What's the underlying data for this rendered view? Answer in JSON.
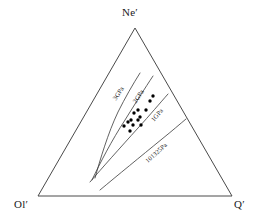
{
  "figure": {
    "type": "ternary-phase-diagram",
    "background_color": "#ffffff",
    "stroke_color": "#3a3a3a",
    "point_color": "#000000",
    "width": 260,
    "height": 221
  },
  "vertices": [
    {
      "id": "ne",
      "label": "Ne′",
      "name": "nepheline-normative",
      "x": 135,
      "y": 28,
      "label_x": 122,
      "label_y": 6
    },
    {
      "id": "ol",
      "label": "Ol′",
      "name": "olivine-normative",
      "x": 38,
      "y": 196,
      "label_x": 14,
      "label_y": 198
    },
    {
      "id": "q",
      "label": "Q′",
      "name": "quartz-normative",
      "x": 232,
      "y": 196,
      "label_x": 234,
      "label_y": 198
    }
  ],
  "curves": [
    {
      "id": "c3gpa",
      "label": "3GPa",
      "pressure_value": 3,
      "pressure_unit": "GPa",
      "path": "M 95,178 C 100,160 108,133 118,112 C 125,98 133,84 140,73",
      "label_x": 114,
      "label_y": 96,
      "label_rotation": -57
    },
    {
      "id": "c2gpa",
      "label": "2GPa",
      "pressure_value": 2,
      "pressure_unit": "GPa",
      "path": "M 92,180 C 100,163 112,140 125,120 C 135,104 145,88 153,76",
      "label_x": 134,
      "label_y": 99,
      "label_rotation": -57
    },
    {
      "id": "c1gpa",
      "label": "1GPa",
      "pressure_value": 1,
      "pressure_unit": "GPa",
      "path": "M 90,182 C 102,168 120,148 138,128 C 150,115 160,103 168,94",
      "label_x": 152,
      "label_y": 117,
      "label_rotation": -50
    },
    {
      "id": "c101325pa",
      "label": "101325Pa",
      "pressure_value": 101325,
      "pressure_unit": "Pa",
      "path": "M 100,190 C 118,175 140,157 162,139 C 172,131 180,124 186,119",
      "label_x": 146,
      "label_y": 158,
      "label_rotation": -42
    }
  ],
  "data_points": {
    "marker": "filled-circle",
    "marker_radius": 1.7,
    "count": 13,
    "points": [
      {
        "x": 128,
        "y": 122
      },
      {
        "x": 131,
        "y": 120
      },
      {
        "x": 133,
        "y": 125
      },
      {
        "x": 138,
        "y": 120
      },
      {
        "x": 140,
        "y": 117
      },
      {
        "x": 134,
        "y": 113
      },
      {
        "x": 138,
        "y": 110
      },
      {
        "x": 130,
        "y": 131
      },
      {
        "x": 141,
        "y": 125
      },
      {
        "x": 146,
        "y": 110
      },
      {
        "x": 150,
        "y": 101
      },
      {
        "x": 153,
        "y": 96
      },
      {
        "x": 124,
        "y": 126
      }
    ]
  }
}
